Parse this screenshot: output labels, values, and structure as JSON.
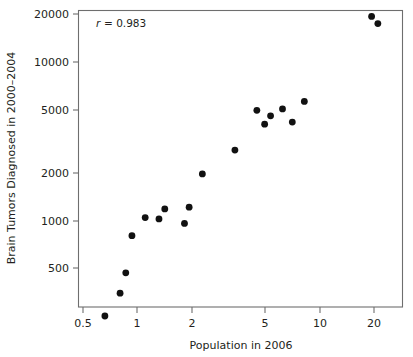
{
  "chart_data": {
    "type": "scatter",
    "title": "",
    "xlabel": "Population in 2006",
    "ylabel": "Brain Tumors Diagnosed in 2000–2004",
    "xscale": "log",
    "yscale": "log",
    "xlim": [
      0.44,
      26.5
    ],
    "ylim": [
      190,
      24000
    ],
    "grid": false,
    "legend": "none",
    "annotations": [
      {
        "name": "correlation",
        "symbol": "r",
        "equals": "= 0.983",
        "text": "r = 0.983",
        "x": 0.62,
        "y": 17500
      }
    ],
    "xticks": [
      0.5,
      1,
      2,
      5,
      10,
      20
    ],
    "xtick_labels": [
      "0.5",
      "1",
      "2",
      "5",
      "10",
      "20"
    ],
    "yticks": [
      500,
      1000,
      2000,
      5000,
      10000,
      20000
    ],
    "ytick_labels": [
      "500",
      "1000",
      "2000",
      "5000",
      "10000",
      "20000"
    ],
    "n_points": 17,
    "marker": "filled-circle",
    "marker_color": "#111111",
    "points": [
      {
        "x": 0.66,
        "y": 249
      },
      {
        "x": 0.8,
        "y": 347
      },
      {
        "x": 0.86,
        "y": 466
      },
      {
        "x": 0.93,
        "y": 800
      },
      {
        "x": 1.1,
        "y": 1040
      },
      {
        "x": 1.31,
        "y": 1020
      },
      {
        "x": 1.41,
        "y": 1180
      },
      {
        "x": 1.81,
        "y": 955
      },
      {
        "x": 1.92,
        "y": 1210
      },
      {
        "x": 2.27,
        "y": 1960
      },
      {
        "x": 3.43,
        "y": 2770
      },
      {
        "x": 4.53,
        "y": 4940
      },
      {
        "x": 5.0,
        "y": 4040
      },
      {
        "x": 5.39,
        "y": 4560
      },
      {
        "x": 6.27,
        "y": 5040
      },
      {
        "x": 7.1,
        "y": 4160
      },
      {
        "x": 8.27,
        "y": 5620
      },
      {
        "x": 19.4,
        "y": 19300
      },
      {
        "x": 21.0,
        "y": 17400
      }
    ]
  },
  "axes": {
    "x_title": "Population in 2006",
    "y_title": "Brain Tumors Diagnosed in 2000–2004",
    "x_tick_labels": [
      "0.5",
      "1",
      "2",
      "5",
      "10",
      "20"
    ],
    "y_tick_labels": [
      "20000",
      "10000",
      "5000",
      "2000",
      "1000",
      "500"
    ]
  },
  "annotation": {
    "symbol": "r",
    "value": "= 0.983"
  },
  "style": {
    "marker_color": "#111111",
    "axis_color": "#6e6e6e",
    "text_color": "#231f20",
    "background": "#ffffff"
  }
}
